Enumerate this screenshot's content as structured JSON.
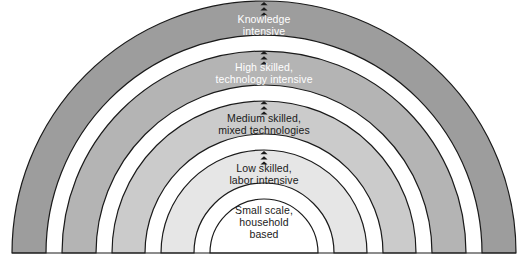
{
  "diagram": {
    "type": "nested-semicircular-arch",
    "title": "",
    "background_color": "#ffffff",
    "stroke_color": "#1a1a1a",
    "baseline_y": 253,
    "center_x": 264,
    "bands": [
      {
        "id": "knowledge-intensive",
        "label": "Knowledge\nintensive",
        "level": 5,
        "fill": "#9d9d9d",
        "text_color": "#ffffff",
        "outer_radius": 252,
        "inner_radius": 218,
        "label_y": 22
      },
      {
        "id": "high-skilled",
        "label": "High skilled,\ntechnology intensive",
        "level": 4,
        "fill": "#b4b4b4",
        "text_color": "#ffffff",
        "outer_radius": 202,
        "inner_radius": 168,
        "label_y": 70
      },
      {
        "id": "medium-skilled",
        "label": "Medium skilled,\nmixed technologies",
        "level": 3,
        "fill": "#cbcbcb",
        "text_color": "#1a1a1a",
        "outer_radius": 152,
        "inner_radius": 119,
        "label_y": 121
      },
      {
        "id": "low-skilled",
        "label": "Low skilled,\nlabor intensive",
        "level": 2,
        "fill": "#e6e6e6",
        "text_color": "#1a1a1a",
        "outer_radius": 103,
        "inner_radius": 70,
        "label_y": 171
      },
      {
        "id": "small-scale",
        "label": "Small scale,\nhousehold\nbased",
        "level": 1,
        "fill": "#ffffff",
        "text_color": "#1a1a1a",
        "outer_radius": 54,
        "inner_radius": 0,
        "label_y": 213
      }
    ],
    "arrows": [
      {
        "id": "arrow-small-to-low",
        "x": 264,
        "y": 151,
        "count": 3,
        "color": "#1a1a1a"
      },
      {
        "id": "arrow-low-to-medium",
        "x": 264,
        "y": 101,
        "count": 3,
        "color": "#1a1a1a"
      },
      {
        "id": "arrow-medium-to-high",
        "x": 264,
        "y": 51,
        "count": 3,
        "color": "#1a1a1a"
      },
      {
        "id": "arrow-high-to-knowledge",
        "x": 264,
        "y": 2,
        "count": 3,
        "color": "#1a1a1a"
      }
    ]
  }
}
